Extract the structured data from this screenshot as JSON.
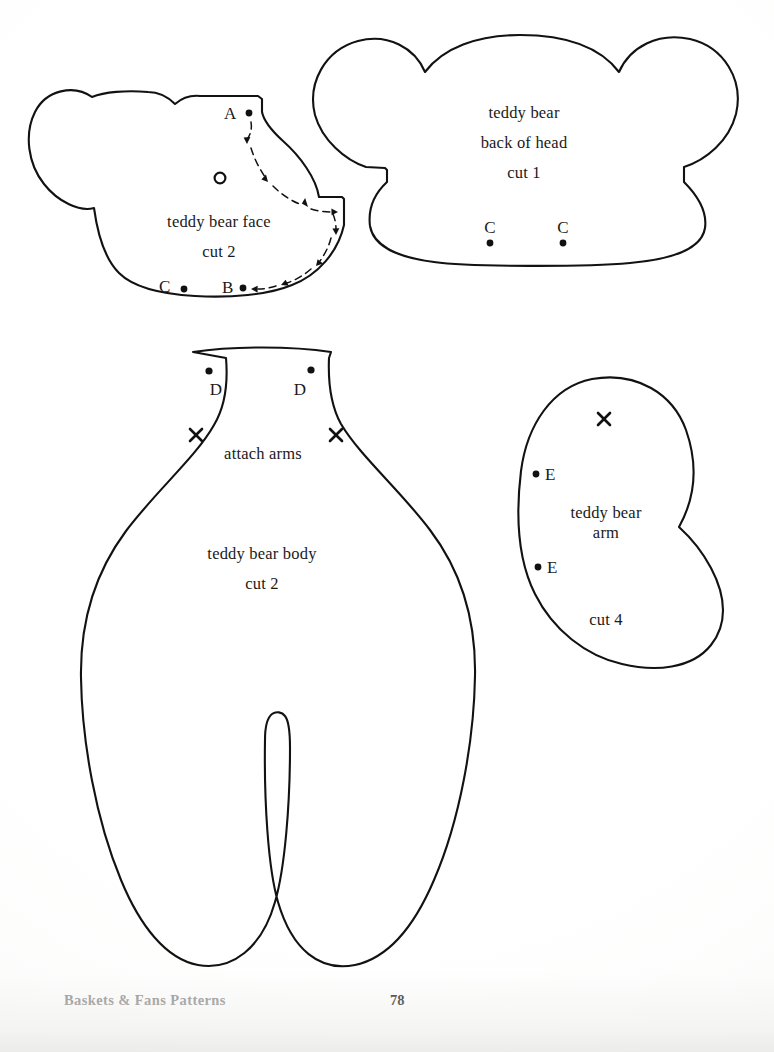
{
  "page": {
    "footer_title": "Baskets & Fans Patterns",
    "page_number": "78",
    "background_color": "#ffffff",
    "ink_color": "#121212"
  },
  "pieces": [
    {
      "id": "teddy-bear-face",
      "caption_lines": [
        "teddy bear face",
        "cut 2"
      ],
      "line1": "teddy bear face",
      "line2": "cut 2",
      "markers": [
        {
          "label": "A",
          "kind": "dot"
        },
        {
          "label": "B",
          "kind": "dot"
        },
        {
          "label": "C",
          "kind": "dot"
        },
        {
          "label": "",
          "kind": "circle"
        }
      ]
    },
    {
      "id": "teddy-bear-back-of-head",
      "caption_lines": [
        "teddy bear",
        "back of head",
        "cut 1"
      ],
      "line1": "teddy bear",
      "line2": "back of head",
      "line3": "cut 1",
      "markers": [
        {
          "label": "C",
          "kind": "dot"
        },
        {
          "label": "C",
          "kind": "dot"
        }
      ]
    },
    {
      "id": "teddy-bear-body",
      "caption_lines": [
        "attach arms",
        "teddy bear body",
        "cut 2"
      ],
      "attach_note": "attach arms",
      "line1": "teddy bear body",
      "line2": "cut 2",
      "markers": [
        {
          "label": "D",
          "kind": "dot"
        },
        {
          "label": "D",
          "kind": "dot"
        },
        {
          "label": "",
          "kind": "x"
        },
        {
          "label": "",
          "kind": "x"
        }
      ]
    },
    {
      "id": "teddy-bear-arm",
      "caption_lines": [
        "teddy bear",
        "arm",
        "cut 4"
      ],
      "line1": "teddy bear",
      "line2": "arm",
      "line3": "cut 4",
      "markers": [
        {
          "label": "E",
          "kind": "dot"
        },
        {
          "label": "E",
          "kind": "dot"
        },
        {
          "label": "",
          "kind": "x"
        }
      ]
    }
  ],
  "labels": {
    "face_A": "A",
    "face_B": "B",
    "face_C": "C",
    "head_C_left": "C",
    "head_C_right": "C",
    "body_D_left": "D",
    "body_D_right": "D",
    "arm_E_top": "E",
    "arm_E_bottom": "E"
  }
}
